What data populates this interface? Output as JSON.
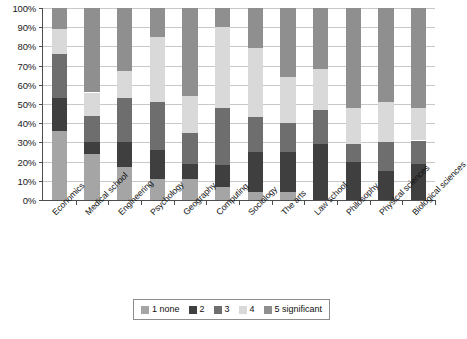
{
  "chart_data": {
    "type": "bar",
    "subtype": "stacked-100-percent",
    "title": "",
    "xlabel": "",
    "ylabel": "",
    "ylim": [
      0,
      100
    ],
    "ytick_labels": [
      "0%",
      "10%",
      "20%",
      "30%",
      "40%",
      "50%",
      "60%",
      "70%",
      "80%",
      "90%",
      "100%"
    ],
    "ytick_values": [
      0,
      10,
      20,
      30,
      40,
      50,
      60,
      70,
      80,
      90,
      100
    ],
    "grid": true,
    "legend_position": "bottom",
    "categories": [
      "Economics",
      "Medical school",
      "Engineering",
      "Psychology",
      "Geography",
      "Computing",
      "Sociology",
      "The arts",
      "Law school",
      "Philosophy",
      "Physical sciences",
      "Biological sciences"
    ],
    "series": [
      {
        "name": "1 none",
        "color": "#a5a5a5",
        "values": [
          36,
          24,
          17,
          11,
          11,
          7,
          4,
          4,
          0,
          0,
          0,
          0
        ]
      },
      {
        "name": "2",
        "color": "#3f3f3f",
        "values": [
          17,
          6,
          13,
          15,
          8,
          11,
          21,
          21,
          29,
          20,
          15,
          19
        ]
      },
      {
        "name": "3",
        "color": "#6e6e6e",
        "values": [
          23,
          14,
          23,
          25,
          16,
          30,
          18,
          15,
          18,
          9,
          15,
          12
        ]
      },
      {
        "name": "4",
        "color": "#d9d9d9",
        "values": [
          13,
          12,
          14,
          34,
          19,
          42,
          36,
          24,
          21,
          19,
          21,
          17
        ]
      },
      {
        "name": "5 significant",
        "color": "#8f8f8f",
        "values": [
          11,
          44,
          33,
          15,
          46,
          10,
          21,
          36,
          32,
          52,
          49,
          52
        ]
      }
    ],
    "stack_order_bottom_to_top": [
      "1 none",
      "2",
      "3",
      "4",
      "5 significant"
    ],
    "legend_entries": [
      {
        "label": "1 none",
        "color": "#a5a5a5"
      },
      {
        "label": "2",
        "color": "#3f3f3f"
      },
      {
        "label": "3",
        "color": "#6e6e6e"
      },
      {
        "label": "4",
        "color": "#d9d9d9"
      },
      {
        "label": "5 significant",
        "color": "#8f8f8f"
      }
    ]
  }
}
